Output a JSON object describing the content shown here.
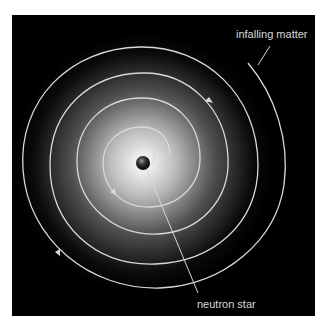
{
  "diagram": {
    "labels": {
      "infalling": "infalling matter",
      "neutron_star": "neutron star"
    },
    "colors": {
      "background": "#000000",
      "spiral": "#d9d9d9",
      "glow_center": "#ffffff",
      "page": "#ffffff"
    }
  }
}
